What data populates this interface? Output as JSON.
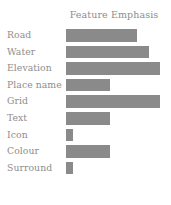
{
  "chart_data": {
    "type": "bar",
    "orientation": "horizontal",
    "title": "Feature Emphasis",
    "xlabel": "",
    "ylabel": "",
    "categories": [
      "Road",
      "Water",
      "Elevation",
      "Place name",
      "Grid",
      "Text",
      "Icon",
      "Colour",
      "Surround"
    ],
    "values": [
      76,
      88,
      100,
      47,
      100,
      47,
      7,
      47,
      7
    ],
    "xlim": [
      0,
      100
    ],
    "ylim": null,
    "grid": false,
    "legend": null,
    "bar_color": "#8a8a8a",
    "text_color": "#8d8d8d",
    "background_color": "#ffffff"
  },
  "chart": {
    "title": "Feature Emphasis",
    "rows": [
      {
        "label": "Road",
        "value": 76,
        "percent": "76%"
      },
      {
        "label": "Water",
        "value": 88,
        "percent": "88%"
      },
      {
        "label": "Elevation",
        "value": 100,
        "percent": "100%"
      },
      {
        "label": "Place name",
        "value": 47,
        "percent": "47%"
      },
      {
        "label": "Grid",
        "value": 100,
        "percent": "100%"
      },
      {
        "label": "Text",
        "value": 47,
        "percent": "47%"
      },
      {
        "label": "Icon",
        "value": 7,
        "percent": "7%"
      },
      {
        "label": "Colour",
        "value": 47,
        "percent": "47%"
      },
      {
        "label": "Surround",
        "value": 7,
        "percent": "7%"
      }
    ]
  }
}
